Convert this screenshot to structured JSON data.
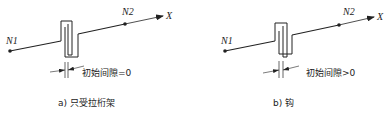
{
  "panels": [
    {
      "id": "a",
      "node_start": "N1",
      "node_end": "N2",
      "axis": "X",
      "gap_label": "初始间隙=0",
      "caption": "a) 只受拉桁架"
    },
    {
      "id": "b",
      "node_start": "N1",
      "node_end": "N2",
      "axis": "X",
      "gap_label": "初始间隙>0",
      "caption": "b) 钩"
    }
  ],
  "colors": {
    "line": "#222222",
    "background": "#ffffff"
  }
}
